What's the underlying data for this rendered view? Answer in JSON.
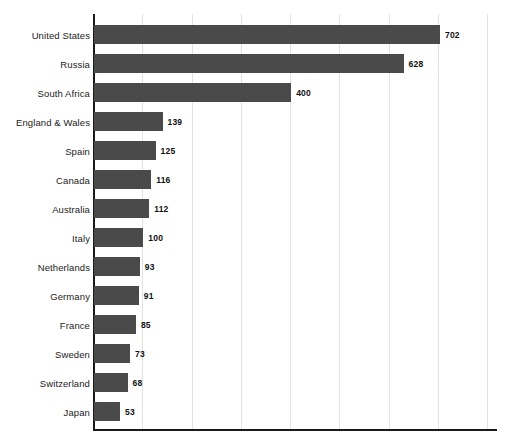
{
  "chart_data": {
    "type": "bar",
    "orientation": "horizontal",
    "title": "",
    "subtitle": "",
    "xlabel": "",
    "ylabel": "",
    "categories": [
      "United States",
      "Russia",
      "South Africa",
      "England & Wales",
      "Spain",
      "Canada",
      "Australia",
      "Italy",
      "Netherlands",
      "Germany",
      "France",
      "Sweden",
      "Switzerland",
      "Japan"
    ],
    "values": [
      702,
      628,
      400,
      139,
      125,
      116,
      112,
      100,
      93,
      91,
      85,
      73,
      68,
      53
    ],
    "value_labels": [
      "702",
      "628",
      "400",
      "139",
      "125",
      "116",
      "112",
      "100",
      "93",
      "91",
      "85",
      "73",
      "68",
      "53"
    ],
    "xlim": [
      0,
      820
    ],
    "xticks": [
      0,
      100,
      200,
      300,
      400,
      500,
      600,
      700,
      800
    ],
    "xtick_labels": [
      "",
      "",
      "",
      "",
      "",
      "",
      "",
      "",
      ""
    ],
    "grid": true,
    "grid_axis": "x",
    "legend": false,
    "legend_position": "none",
    "data_labels": true,
    "sorted": "descending",
    "colors": {
      "bar_fill": "#4a4a4a",
      "axis": "#1a1a1a",
      "gridline": "#e2e2e2",
      "background": "#ffffff",
      "category_label": "#1c1c1c",
      "value_label": "#111111"
    }
  }
}
